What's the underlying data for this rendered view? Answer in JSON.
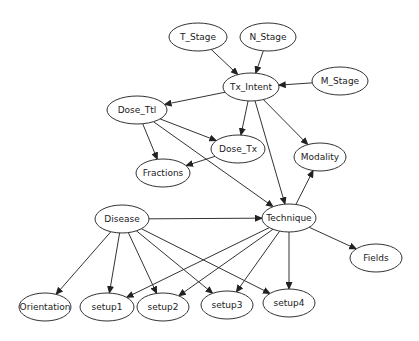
{
  "graph": {
    "type": "directed-acyclic-graph",
    "nodes": [
      {
        "id": "T_Stage",
        "label": "T_Stage",
        "cx": 198,
        "cy": 37,
        "rx": 29,
        "ry": 14
      },
      {
        "id": "N_Stage",
        "label": "N_Stage",
        "cx": 268,
        "cy": 37,
        "rx": 28,
        "ry": 14
      },
      {
        "id": "Tx_Intent",
        "label": "Tx_Intent",
        "cx": 251,
        "cy": 87,
        "rx": 28,
        "ry": 14
      },
      {
        "id": "M_Stage",
        "label": "M_Stage",
        "cx": 340,
        "cy": 81,
        "rx": 28,
        "ry": 14
      },
      {
        "id": "Dose_Ttl",
        "label": "Dose_Ttl",
        "cx": 137,
        "cy": 110,
        "rx": 30,
        "ry": 14
      },
      {
        "id": "Dose_Tx",
        "label": "Dose_Tx",
        "cx": 238,
        "cy": 149,
        "rx": 27,
        "ry": 14
      },
      {
        "id": "Fractions",
        "label": "Fractions",
        "cx": 163,
        "cy": 173,
        "rx": 27,
        "ry": 14
      },
      {
        "id": "Modality",
        "label": "Modality",
        "cx": 320,
        "cy": 157,
        "rx": 26,
        "ry": 14
      },
      {
        "id": "Disease",
        "label": "Disease",
        "cx": 122,
        "cy": 219,
        "rx": 27,
        "ry": 14
      },
      {
        "id": "Technique",
        "label": "Technique",
        "cx": 289,
        "cy": 218,
        "rx": 27,
        "ry": 14
      },
      {
        "id": "Fields",
        "label": "Fields",
        "cx": 376,
        "cy": 258,
        "rx": 26,
        "ry": 14
      },
      {
        "id": "Orientation",
        "label": "Orientation",
        "cx": 45,
        "cy": 307,
        "rx": 26,
        "ry": 14
      },
      {
        "id": "setup1",
        "label": "setup1",
        "cx": 107,
        "cy": 307,
        "rx": 27,
        "ry": 14
      },
      {
        "id": "setup2",
        "label": "setup2",
        "cx": 163,
        "cy": 307,
        "rx": 26,
        "ry": 14
      },
      {
        "id": "setup3",
        "label": "setup3",
        "cx": 227,
        "cy": 305,
        "rx": 26,
        "ry": 14
      },
      {
        "id": "setup4",
        "label": "setup4",
        "cx": 289,
        "cy": 303,
        "rx": 26,
        "ry": 14
      }
    ],
    "edges": [
      {
        "from": "T_Stage",
        "to": "Tx_Intent"
      },
      {
        "from": "N_Stage",
        "to": "Tx_Intent"
      },
      {
        "from": "M_Stage",
        "to": "Tx_Intent"
      },
      {
        "from": "Tx_Intent",
        "to": "Dose_Ttl"
      },
      {
        "from": "Tx_Intent",
        "to": "Dose_Tx"
      },
      {
        "from": "Tx_Intent",
        "to": "Technique"
      },
      {
        "from": "Tx_Intent",
        "to": "Modality"
      },
      {
        "from": "Dose_Ttl",
        "to": "Dose_Tx"
      },
      {
        "from": "Dose_Ttl",
        "to": "Fractions"
      },
      {
        "from": "Dose_Ttl",
        "to": "Technique"
      },
      {
        "from": "Dose_Tx",
        "to": "Fractions"
      },
      {
        "from": "Technique",
        "to": "Modality"
      },
      {
        "from": "Disease",
        "to": "Technique"
      },
      {
        "from": "Technique",
        "to": "Fields"
      },
      {
        "from": "Disease",
        "to": "Orientation"
      },
      {
        "from": "Disease",
        "to": "setup1"
      },
      {
        "from": "Disease",
        "to": "setup2"
      },
      {
        "from": "Disease",
        "to": "setup3"
      },
      {
        "from": "Disease",
        "to": "setup4"
      },
      {
        "from": "Technique",
        "to": "setup1"
      },
      {
        "from": "Technique",
        "to": "setup2"
      },
      {
        "from": "Technique",
        "to": "setup3"
      },
      {
        "from": "Technique",
        "to": "setup4"
      }
    ]
  }
}
